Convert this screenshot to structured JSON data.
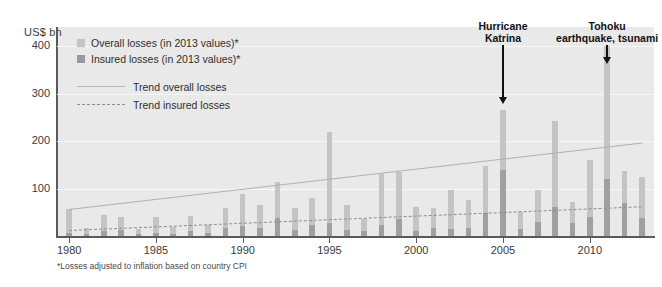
{
  "axis": {
    "y_unit_label": "US$ bn",
    "y_ticks": [
      "100",
      "200",
      "300",
      "400"
    ],
    "y_tick_values": [
      100,
      200,
      300,
      400
    ],
    "x_ticks": [
      "1980",
      "1985",
      "1990",
      "1995",
      "2000",
      "2005",
      "2010"
    ],
    "x_tick_values": [
      1980,
      1985,
      1990,
      1995,
      2000,
      2005,
      2010
    ]
  },
  "legend": {
    "overall_label": "Overall losses (in 2013 values)*",
    "insured_label": "Insured losses (in 2013 values)*",
    "trend_overall_label": "Trend overall losses",
    "trend_insured_label": "Trend insured losses",
    "overall_color": "#c4c4c4",
    "insured_color": "#9a9a9a",
    "trend_overall_color": "#b8b8b8",
    "trend_insured_color": "#8e8e8e"
  },
  "annotations": [
    {
      "label_line1": "Hurricane",
      "label_line2": "Katrina",
      "year": 2005
    },
    {
      "label_line1": "Tohoku",
      "label_line2": "earthquake, tsunami",
      "year": 2011
    }
  ],
  "footnote": "*Losses adjusted to inflation based on country CPI",
  "chart_data": {
    "type": "bar",
    "title": "",
    "subtitle": "",
    "xlabel": "",
    "ylabel": "US$ bn",
    "ylim": [
      0,
      440
    ],
    "xlim": [
      1979.3,
      2013.7
    ],
    "grid": true,
    "legend_position": "top-left",
    "categories": [
      1980,
      1981,
      1982,
      1983,
      1984,
      1985,
      1986,
      1987,
      1988,
      1989,
      1990,
      1991,
      1992,
      1993,
      1994,
      1995,
      1996,
      1997,
      1998,
      1999,
      2000,
      2001,
      2002,
      2003,
      2004,
      2005,
      2006,
      2007,
      2008,
      2009,
      2010,
      2011,
      2012,
      2013
    ],
    "series": [
      {
        "name": "Overall losses (in 2013 values)*",
        "color": "#c4c4c4",
        "values": [
          57,
          16,
          44,
          39,
          14,
          40,
          18,
          43,
          23,
          59,
          89,
          65,
          113,
          58,
          79,
          218,
          66,
          36,
          130,
          135,
          62,
          59,
          96,
          76,
          148,
          265,
          50,
          96,
          243,
          71,
          160,
          400,
          137,
          125
        ]
      },
      {
        "name": "Insured losses (in 2013 values)*",
        "color": "#9a9a9a",
        "values": [
          6,
          5,
          11,
          13,
          5,
          7,
          4,
          11,
          6,
          16,
          22,
          17,
          38,
          13,
          24,
          27,
          13,
          10,
          23,
          35,
          11,
          16,
          14,
          17,
          48,
          140,
          15,
          30,
          61,
          28,
          41,
          120,
          70,
          38
        ]
      }
    ],
    "trend_overall": {
      "name": "Trend overall losses",
      "start_year": 1980,
      "start_value": 57,
      "end_year": 2013,
      "end_value": 197,
      "style": "solid",
      "color": "#b8b8b8"
    },
    "trend_insured": {
      "name": "Trend insured losses",
      "start_year": 1980,
      "start_value": 12,
      "end_year": 2013,
      "end_value": 62,
      "style": "dashed",
      "color": "#8e8e8e"
    }
  }
}
